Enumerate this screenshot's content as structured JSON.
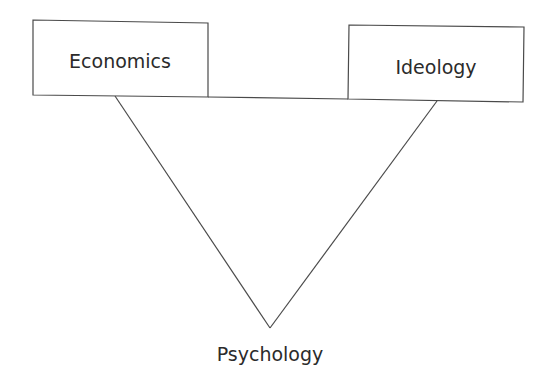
{
  "diagram": {
    "type": "triangle-concept-map",
    "nodes": {
      "economics": {
        "label": "Economics",
        "shape": "box"
      },
      "ideology": {
        "label": "Ideology",
        "shape": "box"
      },
      "psychology": {
        "label": "Psychology",
        "shape": "none"
      }
    },
    "edges": [
      {
        "from": "economics",
        "to": "ideology"
      },
      {
        "from": "economics",
        "to": "psychology"
      },
      {
        "from": "ideology",
        "to": "psychology"
      }
    ],
    "colors": {
      "line": "#4a4a4a",
      "text": "#2b2b2b",
      "background": "#ffffff"
    }
  }
}
